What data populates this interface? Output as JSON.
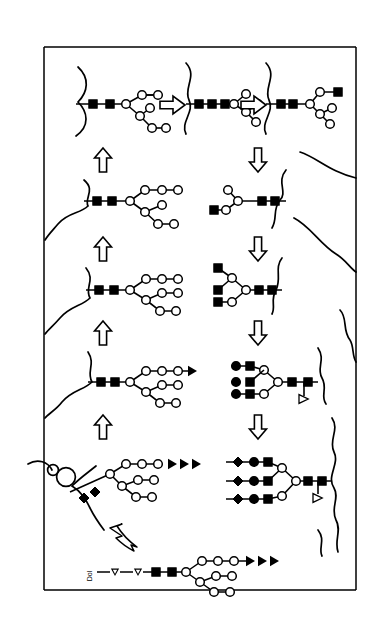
{
  "figure": {
    "background_color": "#ffffff",
    "line_color": "#000000",
    "fill_light": "#ffffff",
    "width": 383,
    "height": 618
  },
  "frame": {
    "name": "er-golgi-cell-boundary-box",
    "left_x": 44,
    "right_x": 356,
    "top_y": 47,
    "bottom_y": 590
  },
  "legend_symbols": [
    {
      "key": "filled-square",
      "meaning": "GlcNAc",
      "shape": "square",
      "fill": "#000000"
    },
    {
      "key": "open-circle",
      "meaning": "Mannose",
      "shape": "circle",
      "fill": "#ffffff"
    },
    {
      "key": "filled-circle",
      "meaning": "Galactose",
      "shape": "circle",
      "fill": "#000000"
    },
    {
      "key": "filled-diamond",
      "meaning": "Sialic acid",
      "shape": "diamond",
      "fill": "#000000"
    },
    {
      "key": "open-triangle",
      "meaning": "Fucose",
      "shape": "triangle",
      "fill": "#ffffff"
    },
    {
      "key": "filled-arrow",
      "meaning": "Chain extension",
      "shape": "arrowhead",
      "fill": "#000000"
    }
  ],
  "rows": [
    {
      "id": "row-1",
      "y": 104,
      "cells": [
        {
          "id": "r1c1",
          "name": "glycan-man5-lipid-linked",
          "squares": 2,
          "branch_mode": "two-arm-lower",
          "terminal_symbol": "open-circle",
          "membrane": "wavy-left"
        },
        {
          "id": "r1c2",
          "name": "glycan-man5-three-glcnac",
          "squares": 3,
          "branch_mode": "compact-fork",
          "terminal_symbol": "open-circle",
          "membrane": "wavy-mid"
        },
        {
          "id": "r1c3",
          "name": "glycan-hybrid-glcnac-capped",
          "squares": 3,
          "branch_mode": "upper-square-cap",
          "terminal_symbol": "filled-square",
          "membrane": "wavy-right"
        }
      ],
      "step_arrows": [
        {
          "name": "step-arrow-right-1",
          "direction": "right",
          "x": 168,
          "y": 105
        },
        {
          "name": "step-arrow-right-2",
          "direction": "right",
          "x": 250,
          "y": 105
        }
      ]
    },
    {
      "id": "row-2",
      "y": 201,
      "cells": [
        {
          "id": "r2c1",
          "name": "glycan-mannose-branched-left",
          "squares": 2,
          "branch_mode": "three-arm",
          "terminal_symbol": "open-circle",
          "membrane": "wavy-left"
        },
        {
          "id": "r2c2",
          "name": "glycan-mannose-branched-right-mirrored",
          "squares": 2,
          "branch_mode": "two-arm-mirrored",
          "terminal_symbol": "filled-square",
          "membrane": "wavy-right"
        }
      ],
      "step_arrows": [
        {
          "name": "step-arrow-up-1",
          "direction": "up",
          "x": 103,
          "y": 165
        },
        {
          "name": "step-arrow-down-1",
          "direction": "down",
          "x": 258,
          "y": 165
        }
      ]
    },
    {
      "id": "row-3",
      "y": 290,
      "cells": [
        {
          "id": "r3c1",
          "name": "glycan-triantennary-mannose",
          "squares": 2,
          "branch_mode": "three-arm",
          "terminal_symbol": "open-circle",
          "membrane": "wavy-left"
        },
        {
          "id": "r3c2",
          "name": "glycan-triantennary-glcnac-mirrored",
          "squares": 2,
          "branch_mode": "three-arm-mirrored",
          "terminal_symbol": "filled-square",
          "membrane": "wavy-right"
        }
      ],
      "step_arrows": [
        {
          "name": "step-arrow-up-2",
          "direction": "up",
          "x": 103,
          "y": 250
        },
        {
          "name": "step-arrow-down-2",
          "direction": "down",
          "x": 258,
          "y": 250
        }
      ]
    },
    {
      "id": "row-4",
      "y": 382,
      "cells": [
        {
          "id": "r4c1",
          "name": "glycan-extending-chain-left",
          "squares": 2,
          "branch_mode": "three-arm",
          "terminal_symbol": "filled-arrow",
          "membrane": "wavy-left"
        },
        {
          "id": "r4c2",
          "name": "glycan-galactosylated-core-fucosylated",
          "squares": 2,
          "branch_mode": "three-arm-mirrored-gal",
          "terminal_symbol": "filled-square",
          "fucose": true,
          "membrane": "wavy-right"
        }
      ],
      "step_arrows": [
        {
          "name": "step-arrow-up-3",
          "direction": "up",
          "x": 103,
          "y": 335
        },
        {
          "name": "step-arrow-down-3",
          "direction": "down",
          "x": 258,
          "y": 335
        }
      ]
    },
    {
      "id": "row-5",
      "y": 481,
      "cells": [
        {
          "id": "r5c1",
          "name": "glycan-sialylated-secreted-left",
          "squares": 2,
          "branch_mode": "three-arm-sialyl",
          "terminal_symbol": "filled-arrow-triple",
          "membrane": "coil-left"
        },
        {
          "id": "r5c2",
          "name": "glycan-fully-sialylated-core-fucosylated",
          "squares": 2,
          "branch_mode": "three-arm-mirrored-sialyl",
          "terminal_symbol": "filled-diamond",
          "fucose": true,
          "membrane": "wavy-right"
        }
      ],
      "step_arrows": [
        {
          "name": "step-arrow-up-4",
          "direction": "up",
          "x": 103,
          "y": 428
        },
        {
          "name": "step-arrow-down-4",
          "direction": "down",
          "x": 258,
          "y": 428
        }
      ]
    },
    {
      "id": "row-6",
      "y": 573,
      "cells": [
        {
          "id": "r6c1",
          "name": "dolichol-linked-precursor",
          "label": "Dol",
          "phosphates": 2,
          "squares": 2,
          "branch_mode": "three-arm",
          "terminal_symbol": "filled-arrow-triple"
        }
      ],
      "step_arrows": [
        {
          "name": "curved-step-arrow",
          "direction": "curved-down-left",
          "x": 120,
          "y": 538
        }
      ]
    }
  ],
  "labels": {
    "dolichol": "Dol"
  }
}
